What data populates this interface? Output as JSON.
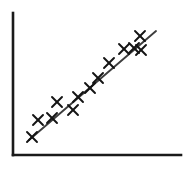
{
  "figure": {
    "title": "",
    "background_color": "#ffffff",
    "width": 196,
    "height": 169
  },
  "axes": {
    "name": "scatter-axes",
    "color": "#1a1a1a",
    "line_width": 2.6,
    "x_axis": {
      "x1": 13,
      "y1": 155,
      "x2": 181,
      "y2": 155
    },
    "y_axis": {
      "x1": 13,
      "y1": 13,
      "x2": 13,
      "y2": 155
    },
    "x_tick_labels": [],
    "y_tick_labels": [],
    "xlabel": "",
    "ylabel": "",
    "grid": false
  },
  "trend_line": {
    "name": "regression-line",
    "color": "#3d3d3d",
    "line_width": 1.9,
    "x1": 29,
    "y1": 140,
    "x2": 156,
    "y2": 31
  },
  "markers": {
    "glyph": "x",
    "color": "#141414",
    "size": 5.0,
    "line_width": 1.9
  },
  "chart_data": {
    "type": "scatter",
    "title": "",
    "xlabel": "",
    "ylabel": "",
    "grid": false,
    "legend": null,
    "marker": "x",
    "xlim": [
      13,
      181
    ],
    "ylim": [
      13,
      155
    ],
    "note": "Coordinates are in pixel space of the 196x169 figure; y increases downward.",
    "series": [
      {
        "name": "observations",
        "marker": "x",
        "color": "#141414",
        "points": [
          {
            "x": 32,
            "y": 137
          },
          {
            "x": 38,
            "y": 120
          },
          {
            "x": 52,
            "y": 118
          },
          {
            "x": 57,
            "y": 102
          },
          {
            "x": 73,
            "y": 110
          },
          {
            "x": 78,
            "y": 97
          },
          {
            "x": 90,
            "y": 88
          },
          {
            "x": 98,
            "y": 78
          },
          {
            "x": 109,
            "y": 63
          },
          {
            "x": 124,
            "y": 49
          },
          {
            "x": 134,
            "y": 48
          },
          {
            "x": 140,
            "y": 36
          },
          {
            "x": 141,
            "y": 50
          }
        ]
      }
    ],
    "trend": {
      "name": "fitted-line",
      "type": "line",
      "color": "#3d3d3d",
      "points": [
        {
          "x": 29,
          "y": 140
        },
        {
          "x": 156,
          "y": 31
        }
      ]
    }
  }
}
